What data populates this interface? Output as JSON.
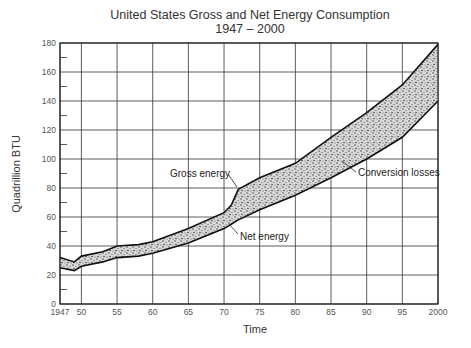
{
  "chart_data": {
    "type": "area",
    "title": "United States Gross and Net Energy Consumption",
    "subtitle": "1947 – 2000",
    "xlabel": "Time",
    "ylabel": "Quadrillion BTU",
    "xlim": [
      1947,
      2000
    ],
    "ylim": [
      0,
      180
    ],
    "x_tick_labels": [
      "1947",
      "50",
      "55",
      "60",
      "65",
      "70",
      "75",
      "80",
      "85",
      "90",
      "95",
      "2000"
    ],
    "y_tick_labels": [
      "0",
      "20",
      "40",
      "60",
      "80",
      "100",
      "120",
      "140",
      "160",
      "180"
    ],
    "grid": true,
    "x": [
      1947,
      1949,
      1950,
      1953,
      1955,
      1958,
      1960,
      1965,
      1970,
      1971,
      1972,
      1975,
      1980,
      1985,
      1990,
      1995,
      2000
    ],
    "series": [
      {
        "name": "Gross energy",
        "values": [
          32,
          29,
          33,
          36,
          40,
          41,
          43,
          52,
          63,
          68,
          79,
          87,
          97,
          115,
          132,
          151,
          179
        ]
      },
      {
        "name": "Net energy",
        "values": [
          25,
          23,
          26,
          29,
          32,
          33,
          35,
          42,
          52,
          55,
          58,
          65,
          75,
          87,
          100,
          115,
          140
        ]
      }
    ],
    "annotations": [
      "Gross energy",
      "Net energy",
      "Conversion losses"
    ],
    "shaded_region": "Conversion losses (between Gross and Net energy)"
  }
}
